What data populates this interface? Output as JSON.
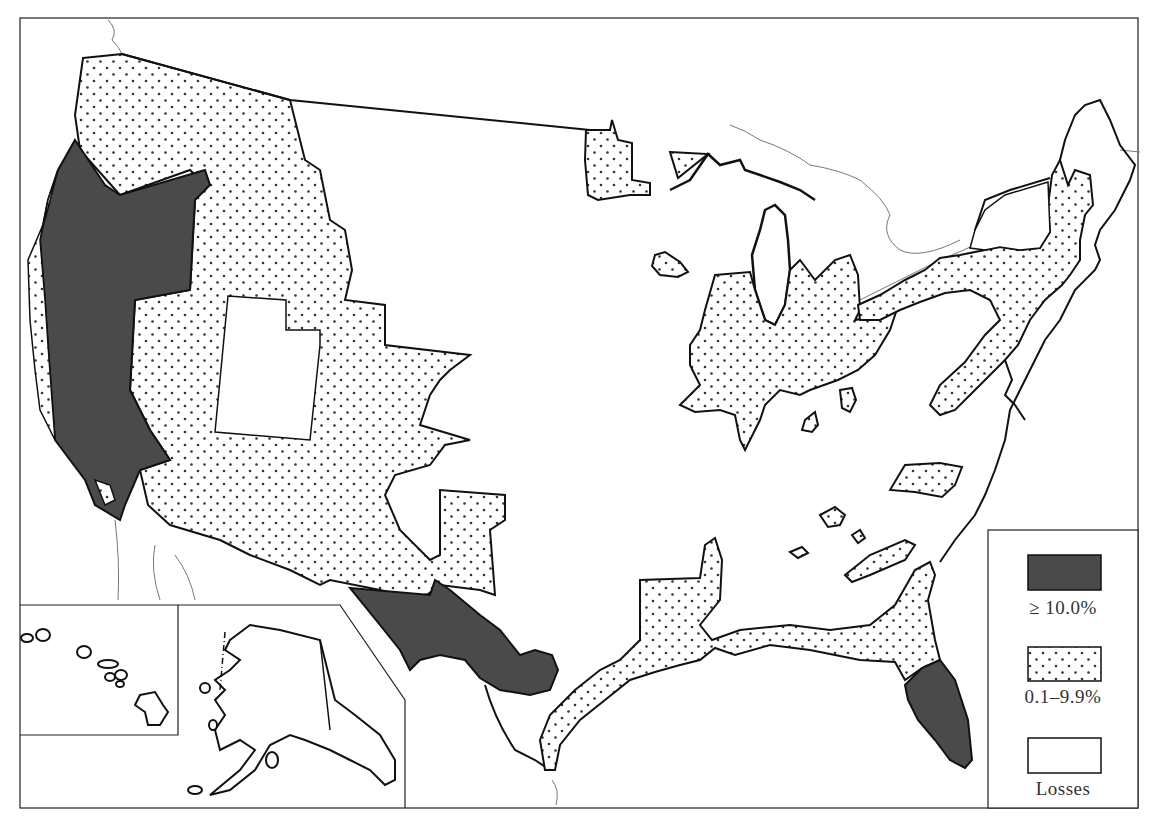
{
  "map": {
    "type": "choropleth",
    "subject": "United States regional percentage change map",
    "colors": {
      "high": "#4a4a4a",
      "mid_dots": "#333333",
      "loss": "#ffffff",
      "outline": "#111111",
      "river": "#777777"
    },
    "legend": {
      "items": [
        {
          "key": "high",
          "label": "≥ 10.0%",
          "pattern": "solid-dark"
        },
        {
          "key": "mid",
          "label": "0.1–9.9%",
          "pattern": "dotted"
        },
        {
          "key": "loss",
          "label": "Losses",
          "pattern": "white"
        }
      ]
    },
    "regions": {
      "high": [
        "Northern California / Oregon coast region",
        "Southern Arizona–New Mexico–Texas border region",
        "South Florida"
      ],
      "mid": [
        "Washington / Idaho / Montana / Wyoming / Colorado / Nevada / Arizona / New Mexico",
        "Minnesota fragments",
        "Lower Michigan / Ohio / Indiana / Illinois",
        "Northeast corridor (Pennsylvania, New York, New England)",
        "Gulf coast (Texas–Louisiana–Mississippi–Alabama–Florida panhandle)",
        "Small scattered southeastern patches",
        "Hawaii/Alaska inset (outlines)"
      ],
      "loss": [
        "Utah",
        "Great Plains / Midwest interior",
        "Southeast interior"
      ]
    },
    "insets": [
      "Hawaii",
      "Alaska"
    ]
  }
}
